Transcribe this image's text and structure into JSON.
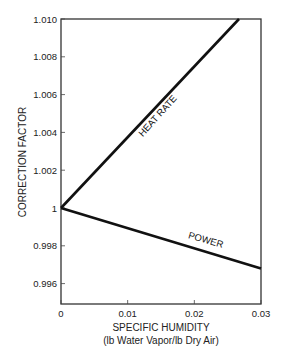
{
  "chart_data": {
    "type": "line",
    "title": "",
    "xlabel": "SPECIFIC HUMIDITY",
    "xlabel_sub": "(lb Water Vapor/lb Dry Air)",
    "ylabel": "CORRECTION FACTOR",
    "xlim": [
      0,
      0.03
    ],
    "ylim": [
      0.995,
      1.01
    ],
    "x_ticks": [
      "0",
      "0.01",
      "0.02",
      "0.03"
    ],
    "x_tick_values": [
      0,
      0.01,
      0.02,
      0.03
    ],
    "y_ticks": [
      "1.010",
      "1.008",
      "1.006",
      "1.004",
      "1.002",
      "1",
      "0.998",
      "0.996"
    ],
    "y_tick_values": [
      1.01,
      1.008,
      1.006,
      1.004,
      1.002,
      1.0,
      0.998,
      0.996
    ],
    "grid": false,
    "legend": "none (inline labels on lines)",
    "series": [
      {
        "name": "HEAT RATE",
        "x": [
          0,
          0.0267
        ],
        "y": [
          1.0,
          1.01
        ]
      },
      {
        "name": "POWER",
        "x": [
          0,
          0.03
        ],
        "y": [
          1.0,
          0.9968
        ]
      }
    ]
  },
  "labels": {
    "heat_rate": "HEAT RATE",
    "power": "POWER"
  },
  "colors": {
    "line": "#111111",
    "axis": "#333333",
    "background": "#ffffff"
  }
}
